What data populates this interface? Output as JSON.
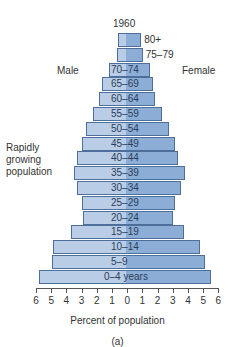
{
  "chart_data": {
    "type": "bar",
    "subtype": "population-pyramid",
    "title": "1960",
    "xlabel": "Percent of population",
    "ylabel": "",
    "caption": "(a)",
    "description": "Rapidly growing population",
    "left_label": "Male",
    "right_label": "Female",
    "xlim": [
      -6,
      6
    ],
    "x_ticks": [
      6,
      5,
      4,
      3,
      2,
      1,
      0,
      1,
      2,
      3,
      4,
      5,
      6
    ],
    "categories": [
      "80+",
      "75-79",
      "70-74",
      "65-69",
      "60-64",
      "55-59",
      "50-54",
      "45-49",
      "40-44",
      "35-39",
      "30-34",
      "25-29",
      "20-24",
      "15-19",
      "10-14",
      "5-9",
      "0-4 years"
    ],
    "series": [
      {
        "name": "Male",
        "color": "#b9cde7",
        "values": [
          0.5,
          0.6,
          1.1,
          1.6,
          1.8,
          2.2,
          2.6,
          2.9,
          3.2,
          3.4,
          3.2,
          2.9,
          2.8,
          3.6,
          4.8,
          4.9,
          5.7
        ]
      },
      {
        "name": "Female",
        "color": "#8badd6",
        "values": [
          1.0,
          1.1,
          1.6,
          1.8,
          1.9,
          2.4,
          2.8,
          3.2,
          3.4,
          3.9,
          3.6,
          3.2,
          3.1,
          3.8,
          4.9,
          5.2,
          5.6
        ]
      }
    ],
    "grid": false,
    "legend": "none"
  },
  "labels": {
    "year": "1960",
    "male": "Male",
    "female": "Female",
    "desc_line1": "Rapidly",
    "desc_line2": "growing",
    "desc_line3": "population",
    "xlabel": "Percent of population",
    "caption": "(a)"
  }
}
